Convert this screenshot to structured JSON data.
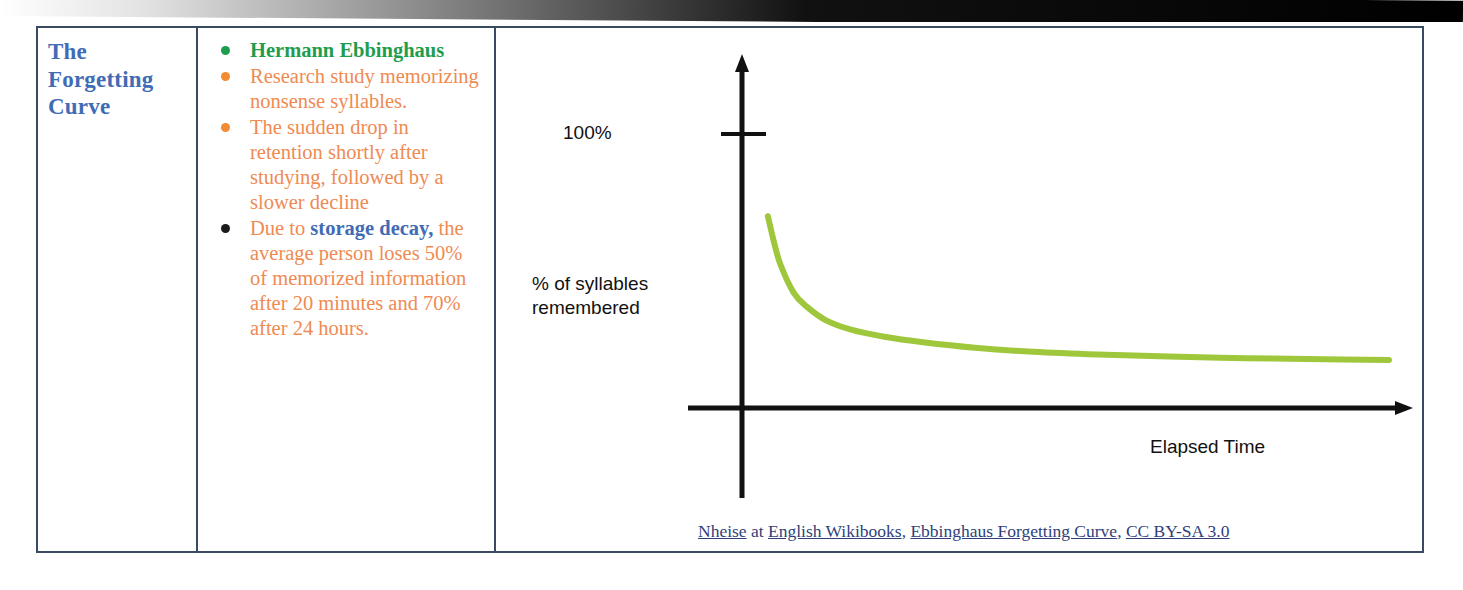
{
  "slide": {
    "title_line1": "The",
    "title_line2": "Forgetting",
    "title_line3": "Curve",
    "bullets": [
      {
        "marker": "green",
        "style": "bold-green",
        "text": "Hermann Ebbinghaus"
      },
      {
        "marker": "orange",
        "style": "orange",
        "text": "Research study memorizing nonsense syllables."
      },
      {
        "marker": "orange",
        "style": "orange",
        "text": "The sudden drop in retention shortly after studying, followed by a slower decline"
      },
      {
        "marker": "black",
        "style": "orange",
        "text_before": "Due to ",
        "text_emphasis": "storage decay,",
        "text_after": " the average person loses 50% of memorized information after 20 minutes and 70% after 24 hours."
      }
    ]
  },
  "chart_data": {
    "type": "line",
    "title": "",
    "xlabel": "Elapsed Time",
    "ylabel": "% of syllables remembered",
    "ytick_labels": [
      "100%"
    ],
    "ytick_values": [
      100
    ],
    "ylim": [
      0,
      115
    ],
    "xlim": [
      0,
      100
    ],
    "grid": false,
    "legend": false,
    "series": [
      {
        "name": "Retention",
        "color": "#9fc73c",
        "x": [
          4,
          5,
          6,
          8,
          10,
          13,
          17,
          22,
          28,
          36,
          45,
          55,
          66,
          78,
          90,
          100
        ],
        "y": [
          70,
          60,
          52,
          42,
          37,
          32,
          28.5,
          26,
          24,
          22,
          20.5,
          19.5,
          18.8,
          18.2,
          17.8,
          17.5
        ]
      }
    ]
  },
  "caption": {
    "segments": [
      {
        "text": "Nheise",
        "link": true
      },
      {
        "text": " at ",
        "link": false
      },
      {
        "text": "English Wikibooks",
        "link": true
      },
      {
        "text": ", ",
        "link": false
      },
      {
        "text": "Ebbinghaus Forgetting Curve",
        "link": true
      },
      {
        "text": ", ",
        "link": false
      },
      {
        "text": "CC BY-SA 3.0",
        "link": true
      }
    ],
    "full_text": "Nheise at English Wikibooks, Ebbinghaus Forgetting Curve, CC BY-SA 3.0"
  },
  "colors": {
    "title_blue": "#3f6cb5",
    "bullet_green": "#1f9d4e",
    "bullet_orange": "#f28b34",
    "body_orange": "#ef8a52",
    "curve_green": "#9fc73c",
    "axis_black": "#111111",
    "table_border": "#3b4a63",
    "caption_blue": "#2f3f7a"
  }
}
